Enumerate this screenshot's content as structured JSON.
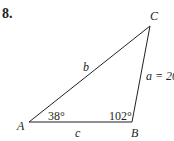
{
  "problem": {
    "number": "8."
  },
  "triangle": {
    "vertices": {
      "A": {
        "label": "A",
        "x": 29,
        "y": 122
      },
      "B": {
        "label": "B",
        "x": 132,
        "y": 122
      },
      "C": {
        "label": "C",
        "x": 150,
        "y": 26
      }
    },
    "sides": {
      "a": {
        "label": "a = 20",
        "opposite": "A"
      },
      "b": {
        "label": "b",
        "opposite": "B"
      },
      "c": {
        "label": "c",
        "opposite": "C"
      }
    },
    "angles": {
      "A": {
        "label": "38°"
      },
      "B": {
        "label": "102°"
      }
    },
    "stroke_color": "#231f20"
  }
}
